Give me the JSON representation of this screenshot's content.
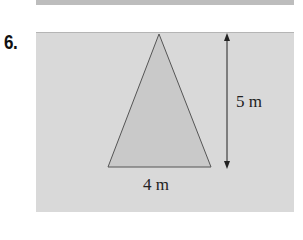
{
  "problem": {
    "number": "6."
  },
  "figure": {
    "shape": "isosceles-triangle",
    "height_label": "5 m",
    "base_label": "4 m",
    "colors": {
      "background": "#d9d9d9",
      "triangle_fill": "#c9c9c9",
      "stroke": "#555555"
    }
  }
}
